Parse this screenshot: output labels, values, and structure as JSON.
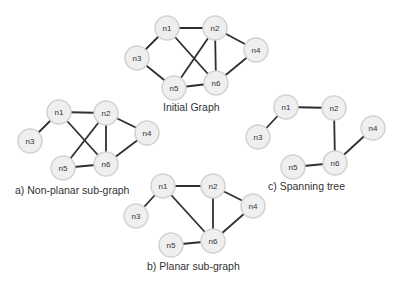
{
  "colors": {
    "edge": "#2f2f2f",
    "node_fill": "#efefef",
    "node_stroke": "#d2d2d2",
    "label": "#333333",
    "background": "#ffffff"
  },
  "graphs": [
    {
      "id": "initial",
      "caption": "Initial Graph",
      "caption_pos": {
        "x": 163,
        "y": 101
      },
      "nodes": [
        {
          "id": "n1",
          "label": "n1",
          "x": 167,
          "y": 28
        },
        {
          "id": "n2",
          "label": "n2",
          "x": 215,
          "y": 28
        },
        {
          "id": "n3",
          "label": "n3",
          "x": 137,
          "y": 58
        },
        {
          "id": "n4",
          "label": "n4",
          "x": 256,
          "y": 50
        },
        {
          "id": "n5",
          "label": "n5",
          "x": 174,
          "y": 88
        },
        {
          "id": "n6",
          "label": "n6",
          "x": 216,
          "y": 83
        }
      ],
      "edges": [
        [
          "n1",
          "n2"
        ],
        [
          "n1",
          "n3"
        ],
        [
          "n1",
          "n6"
        ],
        [
          "n2",
          "n5"
        ],
        [
          "n2",
          "n6"
        ],
        [
          "n2",
          "n4"
        ],
        [
          "n4",
          "n6"
        ],
        [
          "n3",
          "n5"
        ],
        [
          "n5",
          "n6"
        ]
      ]
    },
    {
      "id": "non-planar",
      "caption": "a) Non-planar sub-graph",
      "caption_pos": {
        "x": 15,
        "y": 184
      },
      "nodes": [
        {
          "id": "n1",
          "label": "n1",
          "x": 59,
          "y": 112
        },
        {
          "id": "n2",
          "label": "n2",
          "x": 106,
          "y": 113
        },
        {
          "id": "n3",
          "label": "n3",
          "x": 30,
          "y": 141
        },
        {
          "id": "n4",
          "label": "n4",
          "x": 147,
          "y": 133
        },
        {
          "id": "n5",
          "label": "n5",
          "x": 63,
          "y": 168
        },
        {
          "id": "n6",
          "label": "n6",
          "x": 106,
          "y": 164
        }
      ],
      "edges": [
        [
          "n1",
          "n2"
        ],
        [
          "n1",
          "n3"
        ],
        [
          "n1",
          "n6"
        ],
        [
          "n2",
          "n5"
        ],
        [
          "n2",
          "n6"
        ],
        [
          "n2",
          "n4"
        ],
        [
          "n4",
          "n6"
        ],
        [
          "n5",
          "n6"
        ]
      ]
    },
    {
      "id": "spanning-tree",
      "caption": "c) Spanning tree",
      "caption_pos": {
        "x": 268,
        "y": 180
      },
      "nodes": [
        {
          "id": "n1",
          "label": "n1",
          "x": 286,
          "y": 107
        },
        {
          "id": "n2",
          "label": "n2",
          "x": 334,
          "y": 108
        },
        {
          "id": "n3",
          "label": "n3",
          "x": 258,
          "y": 137
        },
        {
          "id": "n4",
          "label": "n4",
          "x": 373,
          "y": 128
        },
        {
          "id": "n5",
          "label": "n5",
          "x": 293,
          "y": 167
        },
        {
          "id": "n6",
          "label": "n6",
          "x": 335,
          "y": 163
        }
      ],
      "edges": [
        [
          "n1",
          "n2"
        ],
        [
          "n1",
          "n3"
        ],
        [
          "n2",
          "n6"
        ],
        [
          "n4",
          "n6"
        ],
        [
          "n5",
          "n6"
        ]
      ]
    },
    {
      "id": "planar",
      "caption": "b) Planar sub-graph",
      "caption_pos": {
        "x": 147,
        "y": 260
      },
      "nodes": [
        {
          "id": "n1",
          "label": "n1",
          "x": 163,
          "y": 186
        },
        {
          "id": "n2",
          "label": "n2",
          "x": 213,
          "y": 186
        },
        {
          "id": "n3",
          "label": "n3",
          "x": 136,
          "y": 216
        },
        {
          "id": "n4",
          "label": "n4",
          "x": 253,
          "y": 206
        },
        {
          "id": "n5",
          "label": "n5",
          "x": 171,
          "y": 245
        },
        {
          "id": "n6",
          "label": "n6",
          "x": 213,
          "y": 241
        }
      ],
      "edges": [
        [
          "n1",
          "n2"
        ],
        [
          "n1",
          "n3"
        ],
        [
          "n1",
          "n6"
        ],
        [
          "n2",
          "n6"
        ],
        [
          "n2",
          "n4"
        ],
        [
          "n4",
          "n6"
        ],
        [
          "n5",
          "n6"
        ]
      ]
    }
  ],
  "node_radius": 12
}
